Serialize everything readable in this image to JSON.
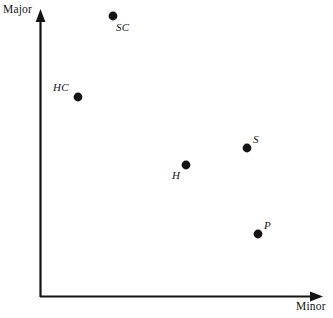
{
  "figure": {
    "background_color": "#ffffff",
    "ink_color": "#141414",
    "width": 333,
    "height": 318
  },
  "axes": {
    "x_title": "Minor",
    "y_title": "Major",
    "x_axis_name": "minor-axis",
    "y_axis_name": "major-axis",
    "arrowheads": true,
    "ticks": false,
    "gridlines": false
  },
  "chart_data": {
    "type": "scatter",
    "title": "",
    "subtitle": "",
    "xlabel": "Minor",
    "ylabel": "Major",
    "xlim": [
      0,
      1
    ],
    "ylim": [
      0,
      1
    ],
    "grid": false,
    "legend": "none",
    "tick_labels": {
      "x": [],
      "y": []
    },
    "annotations": [],
    "marker": {
      "shape": "circle",
      "color": "#141414",
      "radius_px": 4.4
    },
    "points": [
      {
        "label": "SC",
        "px": 113,
        "py": 16,
        "x": 0.258,
        "y": 0.979,
        "label_px": 116,
        "label_py": 21,
        "label_position": "below-right"
      },
      {
        "label": "HC",
        "px": 78,
        "py": 97,
        "x": 0.134,
        "y": 0.697,
        "label_px": 53,
        "label_py": 81,
        "label_position": "left"
      },
      {
        "label": "S",
        "px": 247,
        "py": 148,
        "x": 0.731,
        "y": 0.519,
        "label_px": 253,
        "label_py": 133,
        "label_position": "above-right"
      },
      {
        "label": "H",
        "px": 186,
        "py": 165,
        "x": 0.516,
        "y": 0.46,
        "label_px": 172,
        "label_py": 169,
        "label_position": "below-left"
      },
      {
        "label": "P",
        "px": 258,
        "py": 234,
        "x": 0.77,
        "y": 0.22,
        "label_px": 264,
        "label_py": 219,
        "label_position": "above-right"
      }
    ]
  }
}
